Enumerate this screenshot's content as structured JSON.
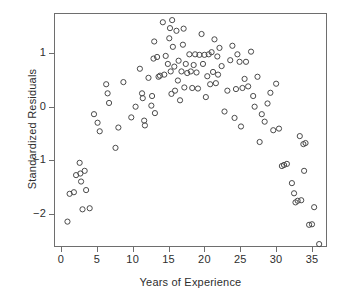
{
  "chart_data": {
    "type": "scatter",
    "title": "",
    "xlabel": "Years of Experience",
    "ylabel": "Standardized Residuals",
    "xlim": [
      -1.0,
      37.1
    ],
    "ylim": [
      -2.85,
      1.8
    ],
    "xticks": [
      0,
      5,
      10,
      15,
      20,
      25,
      30,
      35
    ],
    "xticklabels": [
      "0",
      "5",
      "10",
      "15",
      "20",
      "25",
      "30",
      "35"
    ],
    "yticks": [
      1,
      0,
      -1,
      -2
    ],
    "yticklabels": [
      "1",
      "0",
      "-1",
      "-2"
    ],
    "grid": false,
    "legend": null,
    "marker": "open-circle",
    "marker_color": "#4a4a4a",
    "frame_color": "#6e6e6e",
    "series": [
      {
        "name": "residuals",
        "points": [
          [
            0.9,
            -2.15
          ],
          [
            1.2,
            -1.63
          ],
          [
            1.8,
            -1.6
          ],
          [
            2.1,
            -1.28
          ],
          [
            2.6,
            -1.05
          ],
          [
            2.7,
            -1.25
          ],
          [
            2.8,
            -1.4
          ],
          [
            3.0,
            -1.92
          ],
          [
            3.3,
            -1.2
          ],
          [
            3.5,
            -1.56
          ],
          [
            4.0,
            -1.9
          ],
          [
            4.6,
            -0.14
          ],
          [
            5.1,
            -0.3
          ],
          [
            5.4,
            -0.46
          ],
          [
            6.3,
            0.42
          ],
          [
            6.5,
            0.25
          ],
          [
            6.7,
            0.07
          ],
          [
            7.6,
            -0.77
          ],
          [
            8.0,
            -0.39
          ],
          [
            8.7,
            0.46
          ],
          [
            9.8,
            -0.2
          ],
          [
            10.4,
            0.0
          ],
          [
            11.0,
            0.71
          ],
          [
            11.3,
            0.25
          ],
          [
            11.4,
            0.16
          ],
          [
            11.6,
            -0.26
          ],
          [
            11.7,
            -0.35
          ],
          [
            12.2,
            0.54
          ],
          [
            12.6,
            0.02
          ],
          [
            12.7,
            0.2
          ],
          [
            12.9,
            0.9
          ],
          [
            13.0,
            1.22
          ],
          [
            13.1,
            -0.12
          ],
          [
            13.4,
            0.93
          ],
          [
            13.6,
            0.56
          ],
          [
            13.8,
            0.58
          ],
          [
            14.2,
            1.58
          ],
          [
            14.4,
            0.6
          ],
          [
            14.6,
            0.95
          ],
          [
            14.9,
            0.8
          ],
          [
            15.1,
            1.28
          ],
          [
            15.2,
            1.47
          ],
          [
            15.3,
            0.66
          ],
          [
            15.4,
            0.24
          ],
          [
            15.5,
            1.62
          ],
          [
            15.6,
            1.12
          ],
          [
            15.8,
            0.75
          ],
          [
            15.9,
            0.3
          ],
          [
            16.1,
            1.42
          ],
          [
            16.3,
            0.49
          ],
          [
            16.4,
            0.86
          ],
          [
            16.6,
            0.12
          ],
          [
            16.8,
            0.66
          ],
          [
            17.0,
            1.16
          ],
          [
            17.1,
            1.46
          ],
          [
            17.2,
            0.36
          ],
          [
            17.4,
            0.8
          ],
          [
            17.6,
            0.63
          ],
          [
            17.9,
            0.98
          ],
          [
            18.1,
            0.66
          ],
          [
            18.3,
            0.35
          ],
          [
            18.5,
            0.78
          ],
          [
            18.7,
            0.98
          ],
          [
            18.9,
            0.64
          ],
          [
            19.1,
            0.34
          ],
          [
            19.3,
            0.97
          ],
          [
            19.6,
            1.36
          ],
          [
            19.8,
            0.8
          ],
          [
            20.0,
            0.97
          ],
          [
            20.2,
            0.18
          ],
          [
            20.4,
            0.57
          ],
          [
            20.6,
            0.98
          ],
          [
            20.8,
            0.42
          ],
          [
            21.0,
            1.02
          ],
          [
            21.2,
            0.65
          ],
          [
            21.4,
            1.26
          ],
          [
            21.6,
            0.44
          ],
          [
            21.8,
            0.94
          ],
          [
            21.9,
            0.6
          ],
          [
            22.1,
            1.1
          ],
          [
            22.4,
            0.76
          ],
          [
            22.8,
            -0.09
          ],
          [
            23.2,
            0.3
          ],
          [
            23.6,
            0.87
          ],
          [
            23.9,
            1.14
          ],
          [
            24.2,
            -0.21
          ],
          [
            24.4,
            0.33
          ],
          [
            24.6,
            0.98
          ],
          [
            24.9,
            0.84
          ],
          [
            25.1,
            -0.37
          ],
          [
            25.3,
            0.35
          ],
          [
            25.6,
            0.52
          ],
          [
            25.8,
            0.84
          ],
          [
            26.1,
            0.38
          ],
          [
            26.5,
            1.03
          ],
          [
            26.8,
            0.2
          ],
          [
            27.0,
            0.0
          ],
          [
            27.4,
            0.56
          ],
          [
            27.7,
            -0.66
          ],
          [
            28.0,
            -0.14
          ],
          [
            28.4,
            -0.28
          ],
          [
            28.8,
            0.06
          ],
          [
            29.2,
            0.26
          ],
          [
            29.6,
            -0.44
          ],
          [
            30.0,
            0.43
          ],
          [
            30.4,
            -0.41
          ],
          [
            30.8,
            -1.11
          ],
          [
            31.1,
            -1.09
          ],
          [
            31.5,
            -1.07
          ],
          [
            32.2,
            -1.43
          ],
          [
            32.5,
            -1.62
          ],
          [
            32.7,
            -1.79
          ],
          [
            33.0,
            -1.76
          ],
          [
            33.3,
            -0.55
          ],
          [
            33.5,
            -1.75
          ],
          [
            33.8,
            -0.7
          ],
          [
            33.9,
            -1.2
          ],
          [
            34.1,
            -0.68
          ],
          [
            34.6,
            -2.21
          ],
          [
            35.0,
            -2.2
          ],
          [
            35.3,
            -1.88
          ],
          [
            36.0,
            -2.57
          ]
        ]
      }
    ]
  },
  "axes": {
    "x_title": "Years of Experience",
    "y_title": "Standardized Residuals"
  }
}
